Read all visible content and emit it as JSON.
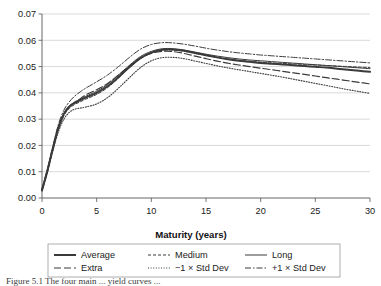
{
  "figure": {
    "caption": "Figure 5.1 The four main ... yield curves ...",
    "background_color": "#ffffff"
  },
  "chart_data": {
    "type": "line",
    "title": "",
    "xlabel": "Maturity (years)",
    "ylabel": "",
    "xlim": [
      0,
      30
    ],
    "ylim": [
      0,
      0.07
    ],
    "xticks": [
      0,
      5,
      10,
      15,
      20,
      25,
      30
    ],
    "xtick_labels": [
      "0",
      "5",
      "10",
      "15",
      "20",
      "25",
      "30"
    ],
    "yticks": [
      0.0,
      0.01,
      0.02,
      0.03,
      0.04,
      0.05,
      0.06,
      0.07
    ],
    "ytick_labels": [
      "0.00",
      "0.01",
      "0.02",
      "0.03",
      "0.04",
      "0.05",
      "0.06",
      "0.07"
    ],
    "grid": "horizontal",
    "legend_position": "below-axes",
    "line_color": "#3a3a3a",
    "x": [
      0,
      0.5,
      1,
      1.5,
      2,
      2.5,
      3,
      3.5,
      4,
      5,
      6,
      7,
      8,
      9,
      10,
      11,
      12,
      13,
      14,
      15,
      16,
      17,
      18,
      19,
      20,
      21,
      22,
      23,
      24,
      25,
      26,
      27,
      28,
      29,
      30
    ],
    "series": [
      {
        "name": "Average",
        "style": "solid-thick",
        "values": [
          0.003,
          0.0105,
          0.019,
          0.0268,
          0.032,
          0.0348,
          0.0362,
          0.0372,
          0.0382,
          0.04,
          0.0425,
          0.046,
          0.0498,
          0.0532,
          0.0553,
          0.0564,
          0.0565,
          0.056,
          0.0552,
          0.0543,
          0.0535,
          0.0528,
          0.0522,
          0.0518,
          0.0514,
          0.0511,
          0.0508,
          0.0505,
          0.0502,
          0.0499,
          0.0496,
          0.0492,
          0.0488,
          0.0484,
          0.048
        ]
      },
      {
        "name": "Medium",
        "style": "dashed-short",
        "values": [
          0.003,
          0.0103,
          0.0186,
          0.0262,
          0.0313,
          0.0341,
          0.0356,
          0.0366,
          0.0376,
          0.0394,
          0.042,
          0.0456,
          0.0496,
          0.053,
          0.0552,
          0.0562,
          0.0563,
          0.0558,
          0.055,
          0.0542,
          0.0535,
          0.0529,
          0.0524,
          0.052,
          0.0517,
          0.0514,
          0.0512,
          0.051,
          0.0508,
          0.0506,
          0.0504,
          0.0502,
          0.05,
          0.0498,
          0.0496
        ]
      },
      {
        "name": "Long",
        "style": "solid-thin",
        "values": [
          0.003,
          0.0106,
          0.0192,
          0.027,
          0.0322,
          0.035,
          0.0365,
          0.0376,
          0.0387,
          0.0406,
          0.0432,
          0.0468,
          0.0505,
          0.0538,
          0.0558,
          0.0568,
          0.0568,
          0.0563,
          0.0555,
          0.0547,
          0.054,
          0.0534,
          0.0529,
          0.0525,
          0.0522,
          0.0519,
          0.0516,
          0.0513,
          0.051,
          0.0507,
          0.0504,
          0.0501,
          0.0498,
          0.0495,
          0.0492
        ]
      },
      {
        "name": "Extra",
        "style": "dashed-long",
        "values": [
          0.003,
          0.0104,
          0.0188,
          0.0265,
          0.0317,
          0.0346,
          0.0364,
          0.0378,
          0.0392,
          0.0412,
          0.0436,
          0.0468,
          0.0502,
          0.0532,
          0.055,
          0.0558,
          0.0557,
          0.055,
          0.054,
          0.053,
          0.0521,
          0.0513,
          0.0506,
          0.05,
          0.0494,
          0.0488,
          0.0482,
          0.0476,
          0.047,
          0.0464,
          0.0458,
          0.0452,
          0.0446,
          0.044,
          0.0434
        ]
      },
      {
        "name": "−1 × Std Dev",
        "style": "dotted",
        "values": [
          0.0026,
          0.0098,
          0.018,
          0.0252,
          0.03,
          0.0326,
          0.0338,
          0.0342,
          0.0346,
          0.0358,
          0.0382,
          0.0418,
          0.0458,
          0.0496,
          0.0522,
          0.0534,
          0.0535,
          0.053,
          0.0521,
          0.0512,
          0.0503,
          0.0495,
          0.0488,
          0.0481,
          0.0474,
          0.0467,
          0.046,
          0.0452,
          0.0444,
          0.0436,
          0.0428,
          0.042,
          0.0412,
          0.0405,
          0.0398
        ]
      },
      {
        "name": "+1 × Std Dev",
        "style": "dash-dot",
        "values": [
          0.0034,
          0.0112,
          0.0198,
          0.028,
          0.0334,
          0.0366,
          0.0388,
          0.0404,
          0.0418,
          0.0442,
          0.0468,
          0.05,
          0.0535,
          0.0566,
          0.0584,
          0.0591,
          0.059,
          0.0585,
          0.0578,
          0.057,
          0.0563,
          0.0557,
          0.0552,
          0.0548,
          0.0544,
          0.0541,
          0.0538,
          0.0535,
          0.0532,
          0.0529,
          0.0526,
          0.0523,
          0.052,
          0.0517,
          0.0514
        ]
      }
    ],
    "legend": [
      {
        "label": "Average",
        "style": "solid-thick"
      },
      {
        "label": "Medium",
        "style": "dashed-short"
      },
      {
        "label": "Long",
        "style": "solid-thin"
      },
      {
        "label": "Extra",
        "style": "dashed-long"
      },
      {
        "label": "−1 × Std Dev",
        "style": "dotted"
      },
      {
        "label": "+1 × Std Dev",
        "style": "dash-dot"
      }
    ]
  }
}
